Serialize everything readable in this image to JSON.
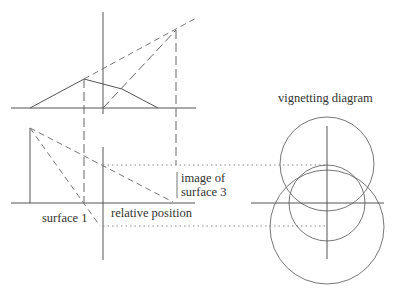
{
  "labels": {
    "vignetting_title": "vignetting diagram",
    "image_of_line1": "image of",
    "image_of_line2": "surface 3",
    "relative_position": "relative position",
    "surface1": "surface 1"
  },
  "colors": {
    "line": "#555555",
    "background": "#ffffff"
  }
}
